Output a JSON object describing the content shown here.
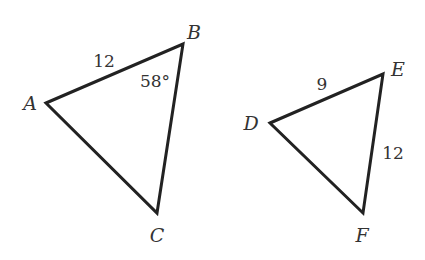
{
  "figure": {
    "triangles": [
      {
        "name": "ABC",
        "vertices": [
          {
            "label": "A",
            "x": 46,
            "y": 103,
            "lx": 30,
            "ly": 110
          },
          {
            "label": "B",
            "x": 183,
            "y": 44,
            "lx": 194,
            "ly": 39
          },
          {
            "label": "C",
            "x": 157,
            "y": 213,
            "lx": 157,
            "ly": 242
          }
        ],
        "measures": [
          {
            "id": "side-ab",
            "text": "12",
            "x": 104,
            "y": 67
          },
          {
            "id": "angle-b",
            "text": "58°",
            "x": 155,
            "y": 87
          }
        ]
      },
      {
        "name": "DEF",
        "vertices": [
          {
            "label": "D",
            "x": 270,
            "y": 123,
            "lx": 251,
            "ly": 130
          },
          {
            "label": "E",
            "x": 383,
            "y": 74,
            "lx": 398,
            "ly": 76
          },
          {
            "label": "F",
            "x": 363,
            "y": 213,
            "lx": 362,
            "ly": 242
          }
        ],
        "measures": [
          {
            "id": "side-de",
            "text": "9",
            "x": 322,
            "y": 90
          },
          {
            "id": "side-ef",
            "text": "12",
            "x": 393,
            "y": 159
          }
        ]
      }
    ]
  },
  "labels": {
    "A": "A",
    "B": "B",
    "C": "C",
    "D": "D",
    "E": "E",
    "F": "F",
    "ab": "12",
    "angleB": "58°",
    "de": "9",
    "ef": "12"
  }
}
